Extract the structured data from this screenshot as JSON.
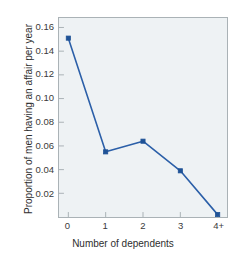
{
  "chart_data": {
    "type": "line",
    "title": "",
    "xlabel": "Number of dependents",
    "ylabel": "Proportion of men having an affair per year",
    "categories": [
      "0",
      "1",
      "2",
      "3",
      "4+"
    ],
    "x": [
      0,
      1,
      2,
      3,
      4
    ],
    "values": [
      0.151,
      0.055,
      0.064,
      0.039,
      0.002
    ],
    "series": [
      {
        "name": "Proportion of men having an affair per year",
        "values": [
          0.151,
          0.055,
          0.064,
          0.039,
          0.002
        ]
      }
    ],
    "ylim": [
      0.0,
      0.168
    ],
    "xlim": [
      -0.25,
      4.25
    ],
    "ytick_labels": [
      "0.02",
      "0.04",
      "0.06",
      "0.08",
      "0.10",
      "0.12",
      "0.14",
      "0.16"
    ],
    "ytick_values": [
      0.02,
      0.04,
      0.06,
      0.08,
      0.1,
      0.12,
      0.14,
      0.16
    ],
    "xtick_labels": [
      "0",
      "1",
      "2",
      "3",
      "4+"
    ],
    "grid": false,
    "legend": "none",
    "marker": "square",
    "line_color": "#2b5fa8",
    "marker_color": "#1f5296",
    "plot_background": "#eef2f4",
    "figure_background": "#ffffff",
    "axis_color": "#aab2b6",
    "tick_text_color": "#3a3a3a"
  }
}
